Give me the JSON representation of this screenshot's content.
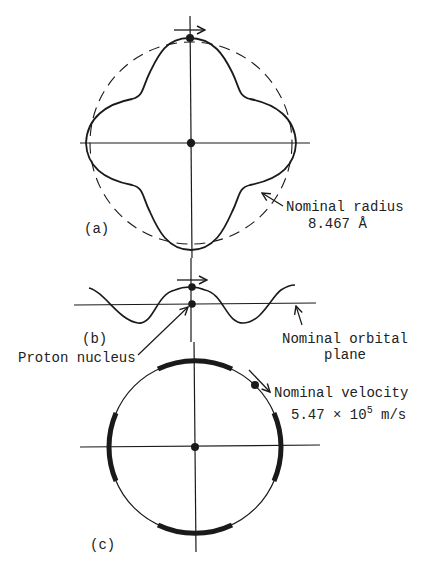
{
  "panels": {
    "a": {
      "label": "(a)",
      "annotation_line1": "Nominal radius",
      "annotation_line2": "8.467 Å"
    },
    "b": {
      "label": "(b)",
      "annotation_plane_line1": "Nominal orbital",
      "annotation_plane_line2": "plane",
      "annotation_nucleus": "Proton nucleus"
    },
    "c": {
      "label": "(c)",
      "annotation_line1": "Nominal velocity",
      "velocity_mantissa": "5.47 × 10",
      "velocity_exponent": "5",
      "velocity_unit": " m/s"
    }
  },
  "colors": {
    "ink": "#1a1a1a",
    "background": "#ffffff"
  }
}
